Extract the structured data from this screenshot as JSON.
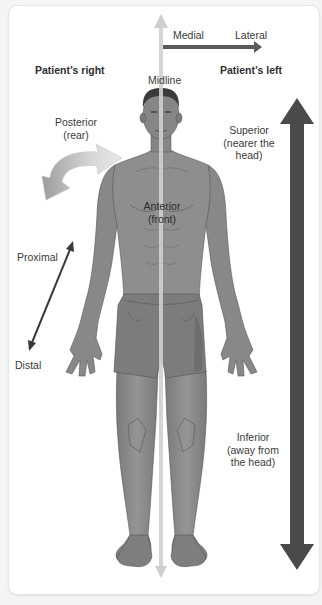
{
  "diagram": {
    "title_hint": "Anatomical directional terms",
    "orientation_labels": {
      "patients_right": "Patient’s right",
      "patients_left": "Patient’s left",
      "midline": "Midline"
    },
    "medial_lateral": {
      "medial": "Medial",
      "lateral": "Lateral"
    },
    "posterior": {
      "line1": "Posterior",
      "line2": "(rear)"
    },
    "anterior": {
      "line1": "Anterior",
      "line2": "(front)"
    },
    "superior": {
      "line1": "Superior",
      "line2": "(nearer the",
      "line3": "head)"
    },
    "inferior": {
      "line1": "Inferior",
      "line2": "(away from",
      "line3": "the head)"
    },
    "proximal": "Proximal",
    "distal": "Distal",
    "colors": {
      "frame_bg": "#ffffff",
      "page_bg": "#f4f4f4",
      "midline_arrow": "#cfcfcf",
      "medial_lateral_arrow": "#5a5a5a",
      "superior_inferior_arrow": "#4a4a4a",
      "proximal_distal_arrow": "#3a3a3a",
      "posterior_arrow": "#b5b5b5",
      "skin": "#8a8a8a",
      "skin_dark": "#6a6a6a",
      "hair": "#3a3a3a",
      "shorts": "#7c7c7c"
    }
  }
}
